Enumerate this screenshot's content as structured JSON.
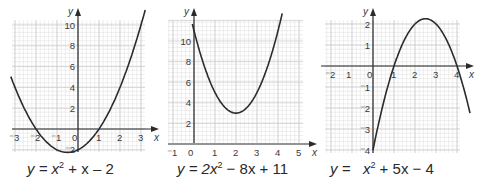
{
  "chart_data": [
    {
      "type": "line",
      "title": "",
      "equation": "y = x^2 + x - 2",
      "xlabel": "x",
      "ylabel": "y",
      "xlim": [
        -3.2,
        3.2
      ],
      "ylim": [
        -2.2,
        10.5
      ],
      "x_ticks": [
        "-3",
        "-2",
        "-1",
        "0",
        "1",
        "2",
        "3"
      ],
      "y_ticks": [
        "-2",
        "2",
        "4",
        "6",
        "8",
        "10"
      ],
      "grid": true,
      "series": [
        {
          "name": "y = x^2 + x - 2",
          "x": [
            -3.2,
            -3,
            -2,
            -1,
            -0.5,
            0,
            1,
            2,
            3,
            3.2
          ],
          "y": [
            5.04,
            4,
            0,
            -2,
            -2.25,
            -2,
            0,
            4,
            10,
            11.44
          ]
        }
      ],
      "roots": [
        -2,
        1
      ],
      "vertex": [
        -0.5,
        -2.25
      ]
    },
    {
      "type": "line",
      "title": "",
      "equation": "y = 2x^2 - 8x + 11",
      "xlabel": "x",
      "ylabel": "y",
      "xlim": [
        -1.2,
        5.2
      ],
      "ylim": [
        0,
        12
      ],
      "x_ticks": [
        "-1",
        "0",
        "1",
        "2",
        "3",
        "4",
        "5"
      ],
      "y_ticks": [
        "2",
        "4",
        "6",
        "8",
        "10"
      ],
      "grid": true,
      "series": [
        {
          "name": "y = 2x^2 - 8x + 11",
          "x": [
            0,
            1,
            2,
            3,
            4,
            4.2
          ],
          "y": [
            11,
            5,
            3,
            5,
            11,
            12.68
          ]
        }
      ],
      "vertex": [
        2,
        3
      ]
    },
    {
      "type": "line",
      "title": "",
      "equation": "y = -x^2 + 5x - 4",
      "xlabel": "x",
      "ylabel": "y",
      "xlim": [
        -2.3,
        4.3
      ],
      "ylim": [
        -4,
        2.4
      ],
      "x_ticks": [
        "-2",
        "1",
        "0",
        "1",
        "2",
        "3",
        "4"
      ],
      "y_ticks": [
        "2",
        "1",
        "-1",
        "-2",
        "-3",
        "-4"
      ],
      "grid": true,
      "series": [
        {
          "name": "y = -x^2 + 5x - 4",
          "x": [
            0,
            1,
            2,
            2.5,
            3,
            4,
            4.6
          ],
          "y": [
            -4,
            0,
            2,
            2.25,
            2,
            0,
            -1.96
          ]
        }
      ],
      "roots": [
        1,
        4
      ],
      "vertex": [
        2.5,
        2.25
      ]
    }
  ],
  "equations": [
    {
      "prefix": "y = ",
      "var": "x",
      "power": "2",
      "rest": " + x – 2"
    },
    {
      "prefix": "y = 2",
      "var": "x",
      "power": "2",
      "rest": " − 8x + 11"
    },
    {
      "prefix": "y =   ",
      "var": "x",
      "power": "2",
      "rest": " + 5x − 4"
    }
  ],
  "style": {
    "curve_color": "#2b2b2b",
    "axis_color": "#2b2b2b",
    "grid_minor": "#e2e2e2",
    "grid_major": "#c8c8c8"
  }
}
